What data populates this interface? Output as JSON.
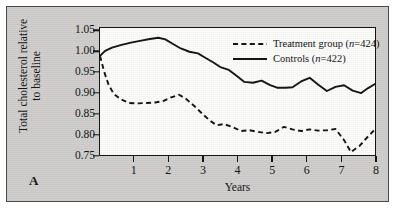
{
  "panel": {
    "label": "A"
  },
  "axes": {
    "x_title": "Years",
    "y_title_line1": "Total cholesterol relative",
    "y_title_line2": "to baseline",
    "x_ticks": [
      "1",
      "2",
      "3",
      "4",
      "5",
      "6",
      "7",
      "8"
    ],
    "y_ticks": [
      "1.05",
      "1.00",
      "0.95",
      "0.90",
      "0.85",
      "0.80",
      "0.75"
    ]
  },
  "legend": {
    "items": [
      {
        "label_prefix": "Treatment group (",
        "label_italic": "n",
        "label_suffix": "=424)",
        "style": "dashed",
        "color": "#111111"
      },
      {
        "label_prefix": "Controls (",
        "label_italic": "n",
        "label_suffix": "=422)",
        "style": "solid",
        "color": "#111111"
      }
    ]
  },
  "chart_data": {
    "type": "line",
    "title": "",
    "xlabel": "Years",
    "ylabel": "Total cholesterol relative to baseline",
    "xlim": [
      0,
      8
    ],
    "ylim": [
      0.75,
      1.0575
    ],
    "grid": false,
    "legend_position": "top-right-inside",
    "x_ticks": [
      1,
      2,
      3,
      4,
      5,
      6,
      7,
      8
    ],
    "y_ticks": [
      0.75,
      0.8,
      0.85,
      0.9,
      0.95,
      1.0,
      1.05
    ],
    "series": [
      {
        "name": "Controls (n=422)",
        "n": 422,
        "style": "solid",
        "color": "#111111",
        "x": [
          0,
          0.15,
          0.35,
          0.6,
          0.9,
          1.2,
          1.45,
          1.7,
          1.9,
          2.1,
          2.35,
          2.6,
          2.85,
          3.05,
          3.3,
          3.5,
          3.75,
          4.0,
          4.2,
          4.45,
          4.7,
          4.95,
          5.15,
          5.4,
          5.6,
          5.85,
          6.1,
          6.35,
          6.6,
          6.85,
          7.1,
          7.35,
          7.6,
          7.8,
          8.0
        ],
        "y": [
          0.99,
          1.002,
          1.01,
          1.016,
          1.022,
          1.027,
          1.031,
          1.034,
          1.03,
          1.02,
          1.008,
          1.0,
          0.996,
          0.986,
          0.974,
          0.963,
          0.956,
          0.94,
          0.927,
          0.925,
          0.93,
          0.919,
          0.913,
          0.913,
          0.914,
          0.928,
          0.937,
          0.92,
          0.905,
          0.915,
          0.919,
          0.906,
          0.9,
          0.912,
          0.922
        ]
      },
      {
        "name": "Treatment group (n=424)",
        "n": 424,
        "style": "dashed",
        "color": "#111111",
        "x": [
          0,
          0.12,
          0.25,
          0.4,
          0.6,
          0.85,
          1.1,
          1.35,
          1.6,
          1.85,
          2.05,
          2.3,
          2.5,
          2.75,
          3.0,
          3.2,
          3.4,
          3.6,
          3.85,
          4.1,
          4.35,
          4.6,
          4.85,
          5.1,
          5.35,
          5.6,
          5.85,
          6.1,
          6.35,
          6.6,
          6.85,
          7.1,
          7.3,
          7.55,
          7.8,
          8.0
        ],
        "y": [
          0.99,
          0.952,
          0.92,
          0.898,
          0.885,
          0.876,
          0.875,
          0.876,
          0.877,
          0.881,
          0.889,
          0.896,
          0.886,
          0.868,
          0.848,
          0.833,
          0.822,
          0.825,
          0.818,
          0.808,
          0.81,
          0.806,
          0.803,
          0.806,
          0.818,
          0.812,
          0.808,
          0.812,
          0.809,
          0.81,
          0.813,
          0.786,
          0.757,
          0.772,
          0.795,
          0.812
        ]
      }
    ]
  }
}
